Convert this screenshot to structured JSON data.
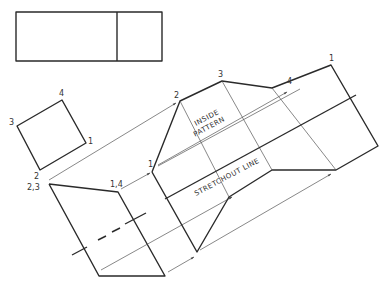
{
  "drawing": {
    "type": "sheet-metal development",
    "labels": {
      "top_view_square": {
        "corner_1": "1",
        "corner_2": "2",
        "corner_3": "3",
        "corner_4": "4"
      },
      "front_view": {
        "left_top": "2,3",
        "right_top": "1,4"
      },
      "pattern": {
        "p1_start": "1",
        "p2": "2",
        "p3": "3",
        "p4": "4",
        "p1_end": "1"
      },
      "inside_pattern_line1": "INSIDE",
      "inside_pattern_line2": "PATTERN",
      "stretchout": "STRETCHOUT  LINE"
    },
    "colors": {
      "line": "#2a2a2a",
      "thin_line": "#555555",
      "background": "#ffffff"
    }
  }
}
